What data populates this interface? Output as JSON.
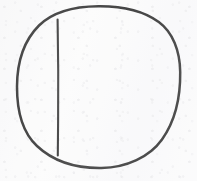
{
  "canvas": {
    "width": 197,
    "height": 181,
    "background_color": "#fbfbfb",
    "description": "hand-drawn circle bisected by a vertical chord"
  },
  "style": {
    "ink_color": "#4a4a4a",
    "ink_color_light": "#5a5a5a",
    "circle_stroke_width": 2.5,
    "chord_stroke_width": 2.1
  },
  "shapes": {
    "circle": {
      "name": "hand-drawn circle outline",
      "center_x": 98.5,
      "center_y": 87,
      "radius_x": 81.5,
      "radius_y": 81,
      "left_edge_x": 17,
      "right_edge_x": 180,
      "top_edge_y": 6,
      "bottom_edge_y": 168,
      "path": "M 98.5 6.2 C 121.5 6.0 143.0 10.4 158.8 22.0 C 172.8 32.3 180.0 51.0 180.2 72.0 C 180.5 95.0 175.5 120.5 162.0 139.5 C 149.5 157.0 126.5 167.6 101.5 168.0 C 76.0 168.4 53.0 161.0 37.0 146.0 C 22.5 132.5 16.9 110.0 17.0 86.5 C 17.1 63.5 23.5 41.0 39.0 25.5 C 53.5 11.0 76.0 6.4 98.5 6.2 Z"
    },
    "chord": {
      "name": "vertical chord line",
      "x": 58,
      "y_start": 19.5,
      "y_end": 155.5,
      "path": "M 57.6 19.5 C 58.2 52.0 58.4 90.0 58.1 122.0 C 58.0 137.0 57.9 148.0 57.8 155.5"
    }
  }
}
